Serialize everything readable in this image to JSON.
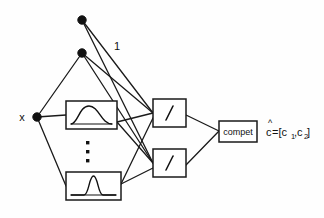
{
  "diagram": {
    "background_color": "#fefefe",
    "line_color": "#1a1a1a",
    "inputs": [
      {
        "id": "bias-top",
        "label": "",
        "name": "bias-node-top"
      },
      {
        "id": "bias-second",
        "label": "",
        "name": "bias-node-second"
      },
      {
        "id": "x-input",
        "label": "x",
        "name": "input-node-x"
      }
    ],
    "labels": {
      "input_x": "x",
      "bias_one": "1",
      "compet": "compet",
      "output_c": "c",
      "output_hat": "^",
      "output_equals": "=[c",
      "output_sub1": "1",
      "output_comma": ",c",
      "output_sub2": "2",
      "output_close": "]",
      "output_full": "c=[c1,c2]",
      "ellipsis": "⋮"
    },
    "hidden_layer": [
      {
        "id": "rbf-1",
        "name": "gaussian-box-top",
        "symbol": "gaussian-wide"
      },
      {
        "id": "rbf-n",
        "name": "gaussian-box-bottom",
        "symbol": "gaussian-narrow"
      }
    ],
    "divide_layer": [
      {
        "id": "div-1",
        "name": "divide-box-top",
        "symbol": "/"
      },
      {
        "id": "div-2",
        "name": "divide-box-bottom",
        "symbol": "/"
      }
    ],
    "output_layer": [
      {
        "id": "compet",
        "name": "compet-box",
        "label": "compet"
      }
    ],
    "edges": [
      {
        "from": "bias-top",
        "to": "div-1"
      },
      {
        "from": "bias-top",
        "to": "div-2"
      },
      {
        "from": "bias-second",
        "to": "div-1"
      },
      {
        "from": "bias-second",
        "to": "div-2"
      },
      {
        "from": "bias-second",
        "to": "x-input"
      },
      {
        "from": "x-input",
        "to": "rbf-1"
      },
      {
        "from": "x-input",
        "to": "rbf-n"
      },
      {
        "from": "rbf-1",
        "to": "div-1"
      },
      {
        "from": "rbf-1",
        "to": "div-2"
      },
      {
        "from": "rbf-n",
        "to": "div-1"
      },
      {
        "from": "rbf-n",
        "to": "div-2"
      },
      {
        "from": "div-1",
        "to": "compet"
      },
      {
        "from": "div-2",
        "to": "compet"
      },
      {
        "from": "compet",
        "to": "output"
      }
    ]
  }
}
